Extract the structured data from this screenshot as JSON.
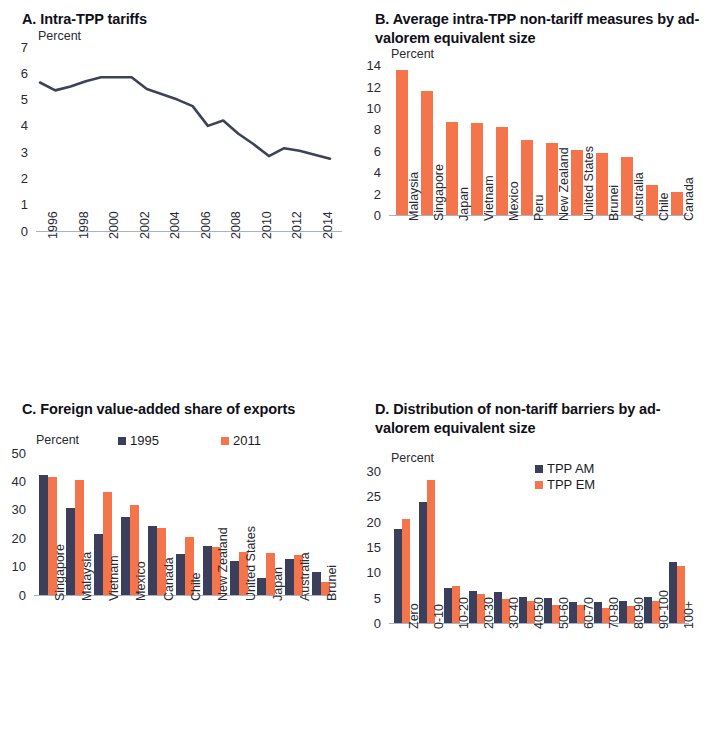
{
  "figure": {
    "axis_unit_label": "Percent",
    "colors": {
      "navy": "#3b3f5c",
      "orange": "#f4754c",
      "line": "#3d4257",
      "axis": "#a9b2c4"
    }
  },
  "panels": {
    "a": {
      "title": "A. Intra-TPP tariffs",
      "unit": "Percent"
    },
    "b": {
      "title": "B. Average intra-TPP non-tariff measures by ad-valorem equivalent size",
      "unit": "Percent"
    },
    "c": {
      "title": "C. Foreign value-added share of exports",
      "unit": "Percent",
      "legend": [
        {
          "label": "1995",
          "color": "#3b3f5c"
        },
        {
          "label": "2011",
          "color": "#f4754c"
        }
      ]
    },
    "d": {
      "title": "D. Distribution of non-tariff barriers by ad-valorem equivalent size",
      "unit": "Percent",
      "legend": [
        {
          "label": "TPP AM",
          "color": "#3b3f5c"
        },
        {
          "label": "TPP EM",
          "color": "#f4754c"
        }
      ]
    }
  },
  "chart_data": [
    {
      "id": "a",
      "type": "line",
      "title": "A. Intra-TPP tariffs",
      "xlabel": "",
      "ylabel": "Percent",
      "ylim": [
        0,
        7
      ],
      "yticks": [
        0,
        1,
        2,
        3,
        4,
        5,
        6,
        7
      ],
      "grid": false,
      "legend_position": "none",
      "x": [
        1996,
        1997,
        1998,
        1999,
        2000,
        2001,
        2002,
        2003,
        2004,
        2005,
        2006,
        2007,
        2008,
        2009,
        2010,
        2011,
        2012,
        2013,
        2014,
        2015
      ],
      "tick_labels": [
        "1996",
        "1998",
        "2000",
        "2002",
        "2004",
        "2006",
        "2008",
        "2010",
        "2012",
        "2014"
      ],
      "series": [
        {
          "name": "Intra-TPP tariffs",
          "color": "#3d4257",
          "values": [
            5.65,
            5.35,
            5.5,
            5.7,
            5.85,
            5.85,
            5.85,
            5.4,
            5.2,
            5.0,
            4.75,
            4.0,
            4.2,
            3.7,
            3.3,
            2.85,
            3.15,
            3.05,
            2.9,
            2.75
          ]
        }
      ]
    },
    {
      "id": "b",
      "type": "bar",
      "title": "B. Average intra-TPP non-tariff measures by ad-valorem equivalent size",
      "xlabel": "",
      "ylabel": "Percent",
      "ylim": [
        0,
        14
      ],
      "yticks": [
        0,
        2,
        4,
        6,
        8,
        10,
        12,
        14
      ],
      "grid": false,
      "legend_position": "none",
      "categories": [
        "Malaysia",
        "Singapore",
        "Japan",
        "Vietnam",
        "Mexico",
        "Peru",
        "New Zealand",
        "United States",
        "Brunei",
        "Australia",
        "Chile",
        "Canada"
      ],
      "values": [
        13.5,
        11.6,
        8.7,
        8.6,
        8.2,
        7.0,
        6.7,
        6.1,
        5.8,
        5.4,
        2.8,
        2.2
      ],
      "color": "#f4754c"
    },
    {
      "id": "c",
      "type": "bar",
      "title": "C. Foreign value-added share of exports",
      "xlabel": "",
      "ylabel": "Percent",
      "ylim": [
        0,
        50
      ],
      "yticks": [
        0,
        10,
        20,
        30,
        40,
        50
      ],
      "grid": false,
      "legend_position": "top-center",
      "categories": [
        "Singapore",
        "Malaysia",
        "Vietnam",
        "Mexico",
        "Canada",
        "Chile",
        "New Zealand",
        "United States",
        "Japan",
        "Australia",
        "Brunei"
      ],
      "series": [
        {
          "name": "1995",
          "color": "#3b3f5c",
          "values": [
            42.0,
            30.5,
            21.3,
            27.3,
            24.0,
            14.4,
            17.2,
            11.8,
            5.8,
            12.6,
            7.8
          ]
        },
        {
          "name": "2011",
          "color": "#f4754c",
          "values": [
            41.5,
            40.4,
            36.2,
            31.4,
            23.4,
            20.3,
            16.7,
            15.1,
            14.8,
            14.1,
            4.4
          ]
        }
      ]
    },
    {
      "id": "d",
      "type": "bar",
      "title": "D. Distribution of non-tariff barriers by ad-valorem equivalent size",
      "xlabel": "",
      "ylabel": "Percent",
      "ylim": [
        0,
        30
      ],
      "yticks": [
        0,
        5,
        10,
        15,
        20,
        25,
        30
      ],
      "grid": false,
      "legend_position": "top-right",
      "categories": [
        "Zero",
        "0-10",
        "10-20",
        "20-30",
        "30-40",
        "40-50",
        "50-60",
        "60-70",
        "70-80",
        "80-90",
        "90-100",
        "100+"
      ],
      "series": [
        {
          "name": "TPP AM",
          "color": "#3b3f5c",
          "values": [
            18.6,
            23.9,
            7.0,
            6.4,
            6.1,
            5.1,
            4.9,
            4.1,
            4.1,
            4.4,
            5.1,
            12.1
          ]
        },
        {
          "name": "TPP EM",
          "color": "#f4754c",
          "values": [
            20.6,
            28.3,
            7.3,
            5.7,
            4.8,
            4.4,
            3.6,
            3.5,
            3.0,
            3.4,
            4.4,
            11.3
          ]
        }
      ]
    }
  ]
}
